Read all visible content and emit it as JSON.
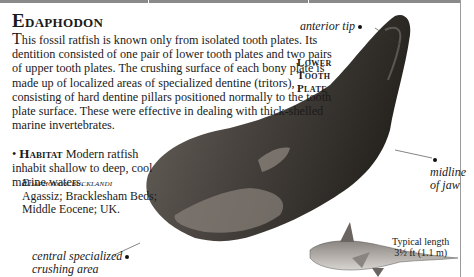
{
  "header": {
    "title": "Edaphodon"
  },
  "description": {
    "dropcap": "T",
    "text": "his fossil ratfish is known only from isolated tooth plates. Its dentition consisted of one pair of lower tooth plates and two pairs of upper tooth plates. The crushing surface of each bony plate is made up of localized areas of specialized dentine (tritors), consisting of hard dentine pillars positioned normally to the tooth plate surface. These were effective in dealing with thick-shelled marine invertebrates."
  },
  "habitat": {
    "bullet": "•",
    "label": "Habitat",
    "text": " Modern ratfish inhabit shallow to deep, cool marine waters."
  },
  "specimen": {
    "species": "Edaphodon bucklandi",
    "details": "Agassiz; Bracklesham Beds; Middle Eocene; UK."
  },
  "plate_label": {
    "line1": "Lower",
    "line2": "Tooth",
    "line3": "Plate"
  },
  "annotations": {
    "anterior_tip": "anterior tip",
    "midline_1": "midline",
    "midline_2": "of jaw",
    "central_1": "central specialized",
    "central_2": "crushing area"
  },
  "scale": {
    "line1": "Typical length",
    "line2": "3½ ft (1.1 m)"
  },
  "colors": {
    "fossil_dark": "#2e2b28",
    "fossil_mid": "#5a5550",
    "fossil_light": "#8c8580",
    "rule": "#8a8a8a"
  }
}
